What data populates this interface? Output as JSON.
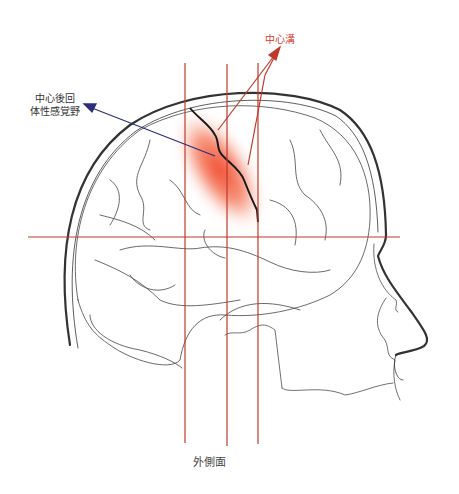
{
  "labels": {
    "central_sulcus": "中心溝",
    "postcentral_gyrus_line1": "中心後回",
    "postcentral_gyrus_line2": "体性感覚野",
    "view": "外側面"
  },
  "colors": {
    "guide_lines": "#c0392b",
    "sulcus_label": "#d0402e",
    "sulcus_arrow": "#c0392b",
    "postcentral_arrow": "#2c2f7a",
    "highlight": "#f04a2a",
    "outline": "#333333"
  }
}
